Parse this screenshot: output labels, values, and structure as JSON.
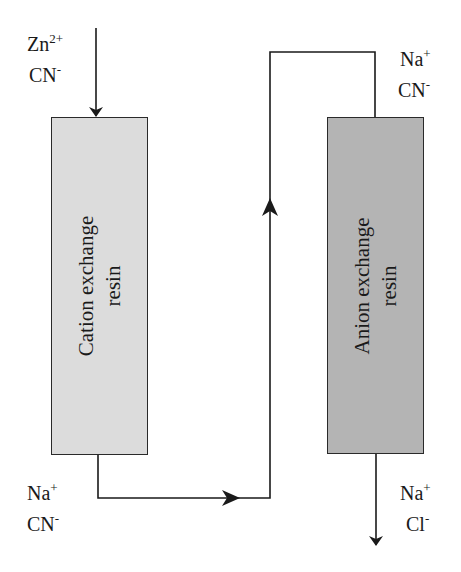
{
  "diagram": {
    "type": "ion-exchange-process-flow",
    "colors": {
      "line": "#1a1a1a",
      "cation_resin_fill": "#dcdcdc",
      "anion_resin_fill": "#b4b4b4",
      "background": "#ffffff"
    },
    "inlet": {
      "ions": [
        {
          "symbol": "Zn",
          "charge": "2+"
        },
        {
          "symbol": "CN",
          "charge": "-"
        }
      ]
    },
    "cation_column": {
      "label_line1": "Cation exchange",
      "label_line2": "resin"
    },
    "intermediate_bottom": {
      "ions": [
        {
          "symbol": "Na",
          "charge": "+"
        },
        {
          "symbol": "CN",
          "charge": "-"
        }
      ]
    },
    "intermediate_top": {
      "ions": [
        {
          "symbol": "Na",
          "charge": "+"
        },
        {
          "symbol": "CN",
          "charge": "-"
        }
      ]
    },
    "anion_column": {
      "label_line1": "Anion exchange",
      "label_line2": "resin"
    },
    "outlet": {
      "ions": [
        {
          "symbol": "Na",
          "charge": "+"
        },
        {
          "symbol": "Cl",
          "charge": "-"
        }
      ]
    }
  }
}
